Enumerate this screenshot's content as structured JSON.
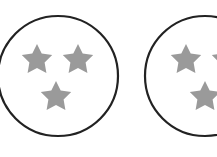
{
  "figure": {
    "background": "#ffffff",
    "circle_stroke_color": "#222222",
    "star_fill_color": "#9a9a9a",
    "circles": [
      {
        "label": "circle-1",
        "cx": 58,
        "cy": 76,
        "r": 60,
        "star_count": 3,
        "stars": [
          {
            "cx": 37,
            "cy": 60
          },
          {
            "cx": 78,
            "cy": 60
          },
          {
            "cx": 56,
            "cy": 97
          }
        ]
      },
      {
        "label": "circle-2",
        "cx": 205,
        "cy": 76,
        "r": 60,
        "star_count": 3,
        "stars": [
          {
            "cx": 186,
            "cy": 60
          },
          {
            "cx": 227,
            "cy": 60
          },
          {
            "cx": 205,
            "cy": 97
          }
        ]
      }
    ]
  }
}
